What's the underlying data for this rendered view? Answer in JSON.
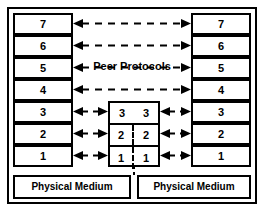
{
  "diagram": {
    "caption": "Peer Protocols",
    "colors": {
      "line": "#000000",
      "background": "#ffffff",
      "text": "#000000"
    },
    "left_stack": {
      "name": "left end system",
      "layers": [
        "7",
        "6",
        "5",
        "4",
        "3",
        "2",
        "1"
      ],
      "medium_label": "Physical Medium"
    },
    "right_stack": {
      "name": "right end system",
      "layers": [
        "7",
        "6",
        "5",
        "4",
        "3",
        "2",
        "1"
      ],
      "medium_label": "Physical Medium"
    },
    "relay": {
      "name": "intermediate relay node",
      "rows": [
        {
          "left": "3",
          "right": "3",
          "divided": false
        },
        {
          "left": "2",
          "right": "2",
          "divided": true
        },
        {
          "left": "1",
          "right": "1",
          "divided": true
        }
      ]
    },
    "arrows": {
      "long_peer_layers": [
        "7",
        "6",
        "5",
        "4"
      ],
      "short_left_layers": [
        "3",
        "2",
        "1"
      ],
      "short_right_layers": [
        "3",
        "2",
        "1"
      ],
      "style": "dashed double-headed"
    }
  }
}
